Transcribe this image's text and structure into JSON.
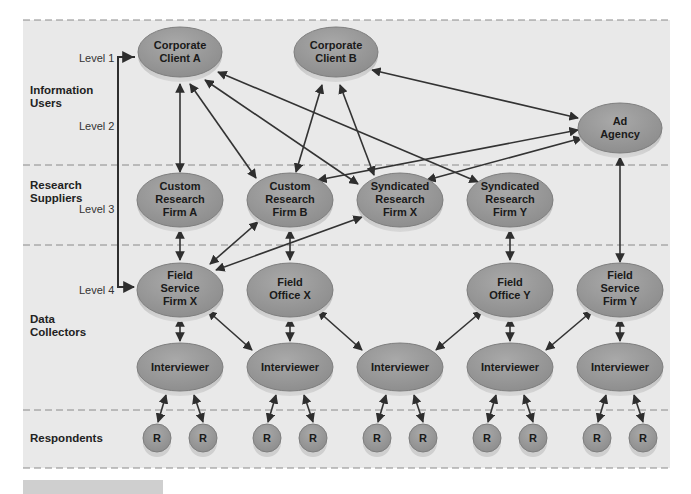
{
  "diagram": {
    "bands": [
      {
        "id": "information-users",
        "label_lines": [
          "Information",
          "Users"
        ]
      },
      {
        "id": "research-suppliers",
        "label_lines": [
          "Research",
          "Suppliers"
        ]
      },
      {
        "id": "data-collectors",
        "label_lines": [
          "Data",
          "Collectors"
        ]
      },
      {
        "id": "respondents",
        "label_lines": [
          "Respondents"
        ]
      }
    ],
    "levels": [
      "Level 1",
      "Level 2",
      "Level 3",
      "Level 4"
    ],
    "nodes": {
      "corporate_client_a": [
        "Corporate",
        "Client A"
      ],
      "corporate_client_b": [
        "Corporate",
        "Client B"
      ],
      "ad_agency": [
        "Ad",
        "Agency"
      ],
      "custom_research_firm_a": [
        "Custom",
        "Research",
        "Firm A"
      ],
      "custom_research_firm_b": [
        "Custom",
        "Research",
        "Firm B"
      ],
      "syndicated_research_firm_x": [
        "Syndicated",
        "Research",
        "Firm X"
      ],
      "syndicated_research_firm_y": [
        "Syndicated",
        "Research",
        "Firm Y"
      ],
      "field_service_firm_x": [
        "Field",
        "Service",
        "Firm X"
      ],
      "field_office_x": [
        "Field",
        "Office X"
      ],
      "field_office_y": [
        "Field",
        "Office Y"
      ],
      "field_service_firm_y": [
        "Field",
        "Service",
        "Firm Y"
      ],
      "interviewer": "Interviewer",
      "respondent": "R"
    },
    "colors": {
      "panel_bg": "#e9e9e9",
      "node_fill": "#9a9a9a",
      "node_edge": "#7a7a7a",
      "node_base": "#c8c8c8",
      "arrow": "#333333",
      "dash": "#8a8a8a"
    }
  }
}
